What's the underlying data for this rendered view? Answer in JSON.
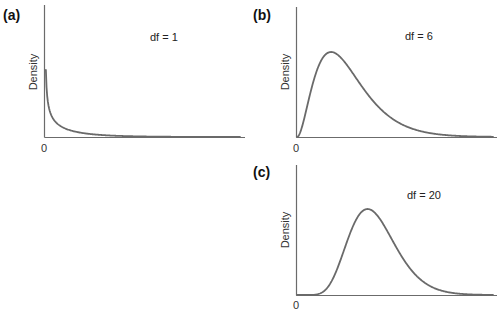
{
  "chart_data": [
    {
      "type": "line",
      "panel": "(a)",
      "title": "",
      "annotation": "df = 1",
      "xlabel": "",
      "ylabel": "Density",
      "x_ticks": [
        "0"
      ],
      "distribution": "chi-square",
      "df": 1,
      "grid": false,
      "legend": null,
      "x": [
        0.02,
        0.1,
        0.25,
        0.5,
        1,
        1.5,
        2,
        3,
        4,
        6,
        8,
        10
      ],
      "values": [
        2.8,
        1.2,
        0.73,
        0.44,
        0.24,
        0.15,
        0.1,
        0.05,
        0.027,
        0.008,
        0.0025,
        0.0008
      ],
      "xlim": [
        0,
        10
      ]
    },
    {
      "type": "line",
      "panel": "(b)",
      "title": "",
      "annotation": "df = 6",
      "xlabel": "",
      "ylabel": "Density",
      "x_ticks": [
        "0"
      ],
      "distribution": "chi-square",
      "df": 6,
      "grid": false,
      "legend": null,
      "x": [
        0,
        1,
        2,
        3,
        4,
        5,
        6,
        8,
        10,
        12,
        15,
        18,
        22
      ],
      "values": [
        0,
        0.038,
        0.092,
        0.126,
        0.135,
        0.128,
        0.112,
        0.073,
        0.042,
        0.022,
        0.008,
        0.0028,
        0.0005
      ],
      "xlim": [
        0,
        23
      ]
    },
    {
      "type": "line",
      "panel": "(c)",
      "title": "",
      "annotation": "df = 20",
      "xlabel": "",
      "ylabel": "Density",
      "x_ticks": [
        "0"
      ],
      "distribution": "chi-square",
      "df": 20,
      "grid": false,
      "legend": null,
      "x": [
        0,
        5,
        10,
        14,
        18,
        22,
        26,
        30,
        35,
        40,
        45,
        50
      ],
      "values": [
        0,
        0.0002,
        0.018,
        0.05,
        0.069,
        0.062,
        0.042,
        0.022,
        0.0083,
        0.0027,
        0.0008,
        0.0002
      ],
      "xlim": [
        0,
        50
      ]
    }
  ],
  "panels": {
    "a": {
      "label": "(a)",
      "ylabel": "Density",
      "df_text": "df = 1",
      "zero": "0"
    },
    "b": {
      "label": "(b)",
      "ylabel": "Density",
      "df_text": "df = 6",
      "zero": "0"
    },
    "c": {
      "label": "(c)",
      "ylabel": "Density",
      "df_text": "df = 20",
      "zero": "0"
    }
  },
  "colors": {
    "axis": "#6b6b6b",
    "curve": "#6a6a6a",
    "text": "#222222"
  }
}
